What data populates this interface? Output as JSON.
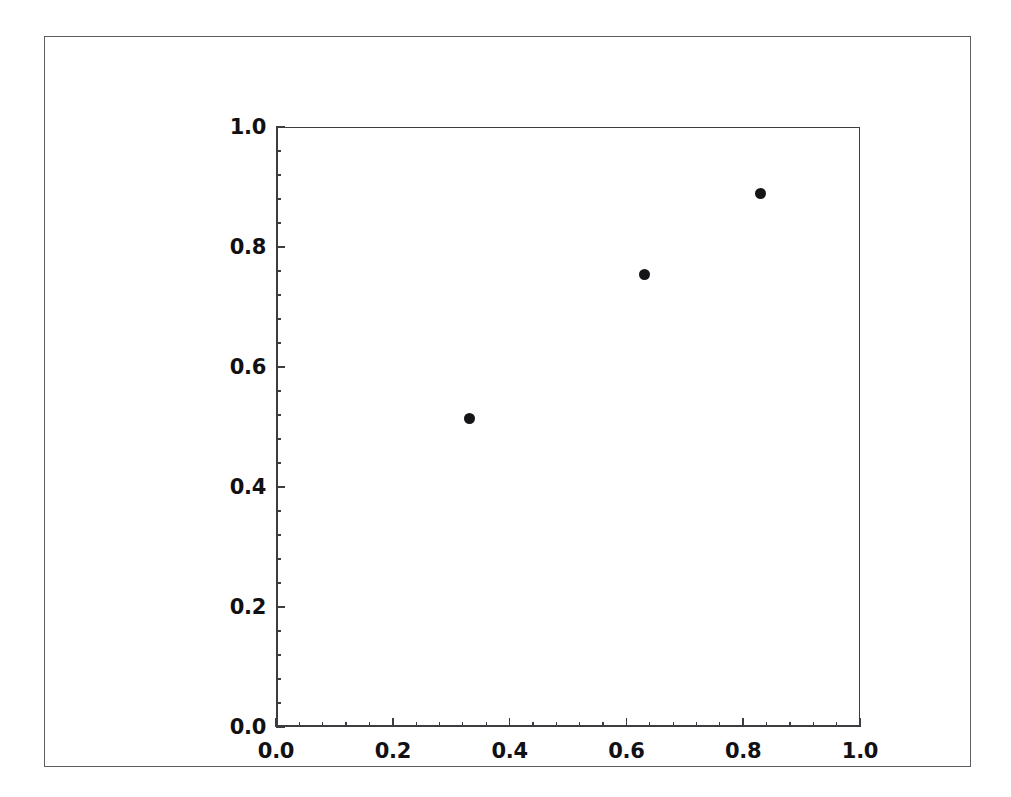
{
  "figure": {
    "background_color": "#ffffff",
    "frame_color": "#5c5c62",
    "axes_color": "#3c3c41",
    "marker_color": "#151518",
    "title": "",
    "xlabel": "",
    "ylabel": ""
  },
  "chart_data": {
    "type": "scatter",
    "title": "",
    "xlabel": "",
    "ylabel": "",
    "xlim": [
      0.0,
      1.0
    ],
    "ylim": [
      0.0,
      1.0
    ],
    "grid": false,
    "legend": null,
    "marker": "circle",
    "marker_color": "#151518",
    "marker_size": 11,
    "xticks": [
      0.0,
      0.2,
      0.4,
      0.6,
      0.8,
      1.0
    ],
    "yticks": [
      0.0,
      0.2,
      0.4,
      0.6,
      0.8,
      1.0
    ],
    "xtick_labels": [
      "0.0",
      "0.2",
      "0.4",
      "0.6",
      "0.8",
      "1.0"
    ],
    "ytick_labels": [
      "0.0",
      "0.2",
      "0.4",
      "0.6",
      "0.8",
      "1.0"
    ],
    "minor_ticks_per_major": 5,
    "tick_direction": "in",
    "series": [
      {
        "name": "",
        "points": [
          {
            "x": 0.331,
            "y": 0.514
          },
          {
            "x": 0.631,
            "y": 0.754
          },
          {
            "x": 0.829,
            "y": 0.889
          }
        ]
      }
    ],
    "x": [
      0.331,
      0.631,
      0.829
    ],
    "values": [
      0.514,
      0.754,
      0.889
    ]
  }
}
